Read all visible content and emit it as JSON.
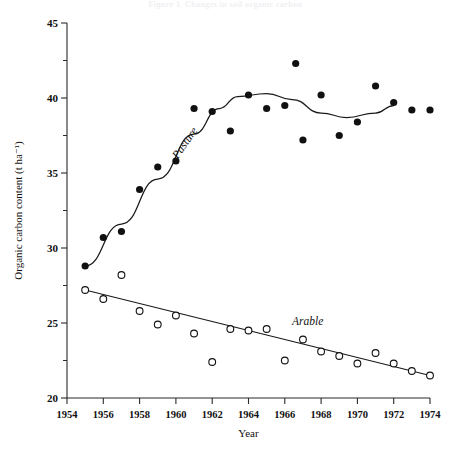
{
  "figure": {
    "caption_partial": "Figure 1. Changes in soil organic carbon",
    "series_labels": {
      "pasture": "Pasture",
      "arable": "Arable"
    }
  },
  "chart_data": {
    "type": "scatter",
    "title": "",
    "xlabel": "Year",
    "ylabel": "Organic carbon content (t ha⁻¹)",
    "xlim": [
      1954,
      1974
    ],
    "ylim": [
      20,
      45
    ],
    "xticks": [
      1954,
      1956,
      1958,
      1960,
      1962,
      1964,
      1966,
      1968,
      1970,
      1972,
      1974
    ],
    "xtick_labels": [
      "1954",
      "1956",
      "1958",
      "1960",
      "1962",
      "1964",
      "1966",
      "1968",
      "1970",
      "1972",
      "1974"
    ],
    "yticks": [
      20,
      25,
      30,
      35,
      40,
      45
    ],
    "ytick_labels": [
      "20",
      "25",
      "30",
      "35",
      "40",
      "45"
    ],
    "yminor_ticks": [
      22.5,
      27.5,
      32.5,
      37.5,
      42.5
    ],
    "grid": false,
    "legend_position": "inline-annotation",
    "series": [
      {
        "name": "Pasture",
        "marker": "filled-circle",
        "color": "#111111",
        "x": [
          1955,
          1956,
          1957,
          1958,
          1959,
          1960,
          1961,
          1962,
          1963,
          1964,
          1965,
          1966,
          1966.6,
          1967,
          1968,
          1969,
          1970,
          1971,
          1972,
          1973,
          1974
        ],
        "y": [
          28.8,
          30.7,
          31.1,
          33.9,
          35.4,
          35.8,
          39.3,
          39.1,
          37.8,
          40.2,
          39.3,
          39.5,
          42.3,
          37.2,
          40.2,
          37.5,
          38.4,
          40.8,
          39.7,
          39.2,
          39.2
        ],
        "fit_label": "Pasture",
        "fit_type": "rise-then-plateau-wave"
      },
      {
        "name": "Arable",
        "marker": "open-circle",
        "color": "#111111",
        "x": [
          1955,
          1956,
          1957,
          1958,
          1959,
          1960,
          1961,
          1962,
          1963,
          1964,
          1965,
          1966,
          1967,
          1968,
          1969,
          1970,
          1971,
          1972,
          1973,
          1974
        ],
        "y": [
          27.2,
          26.6,
          28.2,
          25.8,
          24.9,
          25.5,
          24.3,
          22.4,
          24.6,
          24.5,
          24.6,
          22.5,
          23.9,
          23.1,
          22.8,
          22.3,
          23.0,
          22.3,
          21.8,
          21.5
        ],
        "fit_label": "Arable",
        "fit_type": "linear-decline",
        "fit_endpoints": [
          [
            1955,
            27.2
          ],
          [
            1974,
            21.5
          ]
        ]
      }
    ]
  }
}
